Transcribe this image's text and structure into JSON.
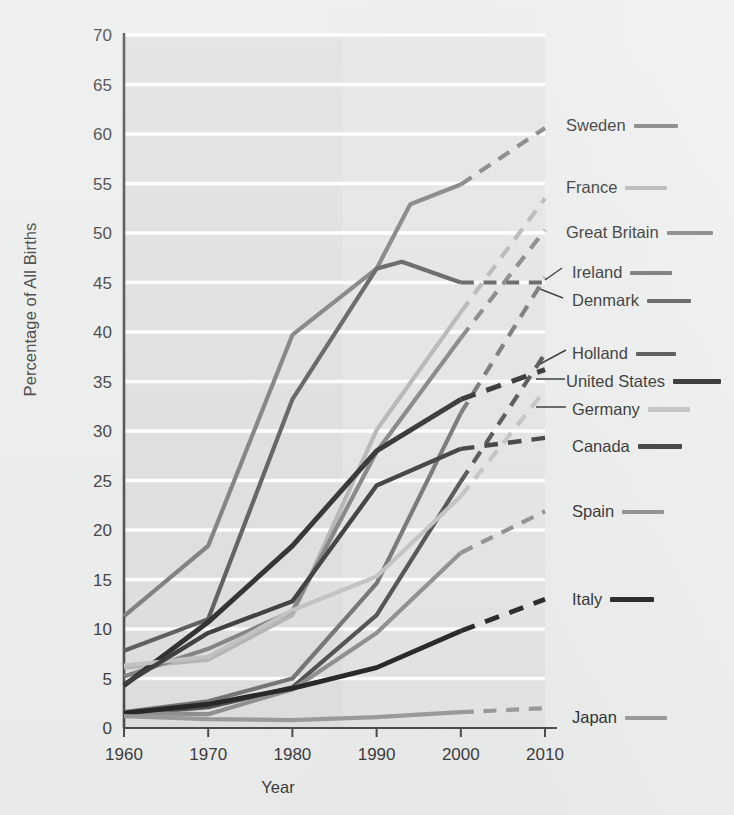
{
  "chart_data": {
    "type": "line",
    "title": "",
    "xlabel": "Year",
    "ylabel": "Percentage of All Births",
    "xlim": [
      1960,
      2010
    ],
    "ylim": [
      0,
      70
    ],
    "xticks": [
      "1960",
      "1970",
      "1980",
      "1990",
      "2000",
      "2010"
    ],
    "yticks": [
      "0",
      "5",
      "10",
      "15",
      "20",
      "25",
      "30",
      "35",
      "40",
      "45",
      "50",
      "55",
      "60",
      "65",
      "70"
    ],
    "grid": "horizontal",
    "legend_position": "right",
    "note": "Solid segments are observed data; dashed segments are projected/extrapolated.",
    "series": [
      {
        "name": "Sweden",
        "color": "#7d7d7d",
        "width": 4.2,
        "solid": [
          [
            1960,
            11.3
          ],
          [
            1970,
            18.4
          ],
          [
            1980,
            39.7
          ],
          [
            1990,
            46.4
          ],
          [
            1994,
            52.9
          ],
          [
            2000,
            54.9
          ]
        ],
        "dashed": [
          [
            2000,
            54.9
          ],
          [
            2010,
            60.6
          ]
        ]
      },
      {
        "name": "France",
        "color": "#b4b4b4",
        "width": 4.2,
        "solid": [
          [
            1960,
            6.1
          ],
          [
            1970,
            6.9
          ],
          [
            1980,
            11.4
          ],
          [
            1990,
            30.1
          ],
          [
            2000,
            42.0
          ]
        ],
        "dashed": [
          [
            2000,
            42.0
          ],
          [
            2010,
            53.5
          ]
        ]
      },
      {
        "name": "Great Britain",
        "color": "#828282",
        "width": 4.2,
        "solid": [
          [
            1960,
            5.2
          ],
          [
            1970,
            8.0
          ],
          [
            1980,
            11.8
          ],
          [
            1990,
            27.9
          ],
          [
            2000,
            39.4
          ]
        ],
        "dashed": [
          [
            2000,
            39.4
          ],
          [
            2010,
            50.3
          ]
        ]
      },
      {
        "name": "Ireland",
        "color": "#737373",
        "width": 4.2,
        "solid": [
          [
            1960,
            1.6
          ],
          [
            1970,
            2.7
          ],
          [
            1980,
            5.0
          ],
          [
            1990,
            14.6
          ],
          [
            2000,
            31.8
          ]
        ],
        "dashed": [
          [
            2000,
            31.8
          ],
          [
            2010,
            45.5
          ]
        ]
      },
      {
        "name": "Denmark",
        "color": "#5b5b5b",
        "width": 4.2,
        "solid": [
          [
            1960,
            7.8
          ],
          [
            1970,
            11.0
          ],
          [
            1980,
            33.2
          ],
          [
            1990,
            46.4
          ],
          [
            1993,
            47.1
          ],
          [
            2000,
            45.0
          ]
        ],
        "dashed": [
          [
            2000,
            45.0
          ],
          [
            2010,
            45.0
          ]
        ]
      },
      {
        "name": "Holland",
        "color": "#4f4f4f",
        "width": 4.2,
        "solid": [
          [
            1960,
            1.4
          ],
          [
            1970,
            2.1
          ],
          [
            1980,
            4.1
          ],
          [
            1990,
            11.4
          ],
          [
            2000,
            24.9
          ]
        ],
        "dashed": [
          [
            2000,
            24.9
          ],
          [
            2010,
            37.8
          ]
        ]
      },
      {
        "name": "United States",
        "color": "#2b2b2b",
        "width": 5.0,
        "solid": [
          [
            1960,
            4.3
          ],
          [
            1970,
            10.7
          ],
          [
            1980,
            18.4
          ],
          [
            1990,
            28.0
          ],
          [
            2000,
            33.2
          ]
        ],
        "dashed": [
          [
            2000,
            33.2
          ],
          [
            2010,
            36.2
          ]
        ]
      },
      {
        "name": "Germany",
        "color": "#c2c2c2",
        "width": 4.2,
        "solid": [
          [
            1960,
            6.3
          ],
          [
            1970,
            7.2
          ],
          [
            1980,
            11.9
          ],
          [
            1990,
            15.3
          ],
          [
            2000,
            23.4
          ]
        ],
        "dashed": [
          [
            2000,
            23.4
          ],
          [
            2010,
            34.1
          ]
        ]
      },
      {
        "name": "Canada",
        "color": "#3a3a3a",
        "width": 4.4,
        "solid": [
          [
            1960,
            4.4
          ],
          [
            1970,
            9.6
          ],
          [
            1980,
            12.8
          ],
          [
            1990,
            24.5
          ],
          [
            2000,
            28.2
          ]
        ],
        "dashed": [
          [
            2000,
            28.2
          ],
          [
            2010,
            29.3
          ]
        ]
      },
      {
        "name": "Spain",
        "color": "#8e8e8e",
        "width": 4.2,
        "solid": [
          [
            1960,
            1.5
          ],
          [
            1970,
            1.4
          ],
          [
            1980,
            3.9
          ],
          [
            1990,
            9.6
          ],
          [
            2000,
            17.7
          ]
        ],
        "dashed": [
          [
            2000,
            17.7
          ],
          [
            2010,
            21.9
          ]
        ]
      },
      {
        "name": "Italy",
        "color": "#232323",
        "width": 4.8,
        "solid": [
          [
            1960,
            1.5
          ],
          [
            1970,
            2.4
          ],
          [
            1980,
            4.0
          ],
          [
            1990,
            6.1
          ],
          [
            2000,
            9.8
          ]
        ],
        "dashed": [
          [
            2000,
            9.8
          ],
          [
            2010,
            13.0
          ]
        ]
      },
      {
        "name": "Japan",
        "color": "#999999",
        "width": 4.2,
        "solid": [
          [
            1960,
            1.2
          ],
          [
            1970,
            0.9
          ],
          [
            1980,
            0.8
          ],
          [
            1990,
            1.1
          ],
          [
            2000,
            1.6
          ]
        ],
        "dashed": [
          [
            2000,
            1.6
          ],
          [
            2010,
            2.0
          ]
        ]
      }
    ]
  },
  "legend": [
    {
      "label": "Sweden",
      "color": "#7d7d7d",
      "width": 4,
      "top": 116,
      "left": 566,
      "swatch": 44
    },
    {
      "label": "France",
      "color": "#b4b4b4",
      "width": 4,
      "top": 178,
      "left": 566,
      "swatch": 42
    },
    {
      "label": "Great Britain",
      "color": "#828282",
      "width": 4,
      "top": 223,
      "left": 566,
      "swatch": 46
    },
    {
      "label": "Ireland",
      "color": "#737373",
      "width": 4,
      "top": 263,
      "left": 572,
      "swatch": 42
    },
    {
      "label": "Denmark",
      "color": "#5b5b5b",
      "width": 4,
      "top": 291,
      "left": 572,
      "swatch": 44
    },
    {
      "label": "Holland",
      "color": "#4f4f4f",
      "width": 4,
      "top": 344,
      "left": 572,
      "swatch": 40
    },
    {
      "label": "United States",
      "color": "#2b2b2b",
      "width": 5.5,
      "top": 372,
      "left": 566,
      "swatch": 48
    },
    {
      "label": "Germany",
      "color": "#c2c2c2",
      "width": 4.5,
      "top": 400,
      "left": 572,
      "swatch": 42
    },
    {
      "label": "Canada",
      "color": "#3a3a3a",
      "width": 5,
      "top": 437,
      "left": 572,
      "swatch": 44
    },
    {
      "label": "Spain",
      "color": "#8e8e8e",
      "width": 4,
      "top": 502,
      "left": 572,
      "swatch": 42
    },
    {
      "label": "Italy",
      "color": "#232323",
      "width": 5,
      "top": 590,
      "left": 572,
      "swatch": 44
    },
    {
      "label": "Japan",
      "color": "#999999",
      "width": 4,
      "top": 708,
      "left": 572,
      "swatch": 42
    }
  ],
  "leaders": [
    {
      "name": "ireland-leader",
      "d": "M 545 280 L 562 268"
    },
    {
      "name": "denmark-leader",
      "d": "M 540 289 L 563 298"
    },
    {
      "name": "holland-leader",
      "d": "M 540 364 L 566 350"
    },
    {
      "name": "united-states-leader",
      "d": "M 536 379 L 565 379"
    },
    {
      "name": "germany-leader",
      "d": "M 536 407 L 566 407"
    }
  ],
  "axes": {
    "plot_left": 124,
    "plot_right": 545,
    "plot_top": 35,
    "plot_bottom": 728
  }
}
